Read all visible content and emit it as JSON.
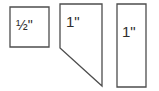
{
  "diagram": {
    "background_color": "#ffffff",
    "line_color": "#4d4d4d",
    "text_color": "#2e2e2e",
    "shapes": [
      {
        "name": "half-inch-square",
        "type": "square",
        "label": "½\"",
        "points": "10,7 49,7 49,47 10,47"
      },
      {
        "name": "one-inch-angled-piece",
        "type": "polygon-with-diagonal-cut",
        "label": "1\"",
        "points": "60,4 102,4 102,86 60,48"
      },
      {
        "name": "one-inch-rectangle",
        "type": "rectangle",
        "label": "1\"",
        "points": "117,4 146,4 146,87 117,87"
      }
    ]
  }
}
